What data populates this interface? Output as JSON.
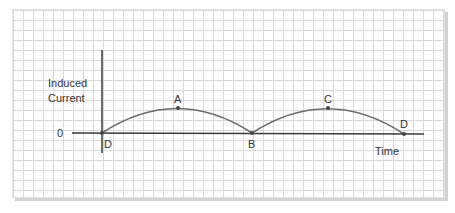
{
  "diagram": {
    "y_axis_label_line1": "Induced",
    "y_axis_label_line2": "Current",
    "x_axis_label": "Time",
    "origin_label": "0",
    "points": [
      {
        "label": "D",
        "x": 102,
        "y": 133
      },
      {
        "label": "A",
        "x": 178,
        "y": 108
      },
      {
        "label": "B",
        "x": 252,
        "y": 133
      },
      {
        "label": "C",
        "x": 328,
        "y": 108
      },
      {
        "label": "D",
        "x": 404,
        "y": 134
      }
    ],
    "colors": {
      "curve": "#6b6b6b",
      "axis": "#3a3a3a",
      "grid": "#d9d9d9",
      "text": "#333333"
    }
  }
}
